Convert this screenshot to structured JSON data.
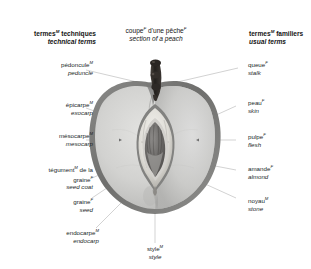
{
  "headings": {
    "left": {
      "fr": "termes",
      "fr_gender": "M",
      "fr_rest": " techniques",
      "en": "technical terms"
    },
    "center": {
      "fr": "coupe",
      "fr_gender": "F",
      "fr_rest": " d'une pêche",
      "fr_gender2": "F",
      "en": "section of a peach"
    },
    "right": {
      "fr": "termes",
      "fr_gender": "M",
      "fr_rest": " familiers",
      "en": "usual terms"
    }
  },
  "labels": {
    "peduncle": {
      "fr": "pédoncule",
      "gender": "M",
      "en": "peduncle"
    },
    "exocarp": {
      "fr": "épicarpe",
      "gender": "M",
      "en": "exocarp"
    },
    "mesocarp": {
      "fr": "mésocarpe",
      "gender": "M",
      "en": "mesocarp"
    },
    "seed_coat": {
      "fr_line1": "tégument",
      "gender": "M",
      "fr_line1_rest": " de la",
      "fr_line2": "graine",
      "gender2": "F",
      "en": "seed coat"
    },
    "seed": {
      "fr": "graine",
      "gender": "F",
      "en": "seed"
    },
    "endocarp": {
      "fr": "endocarpe",
      "gender": "M",
      "en": "endocarp"
    },
    "stalk": {
      "fr": "queue",
      "gender": "F",
      "en": "stalk"
    },
    "skin": {
      "fr": "peau",
      "gender": "F",
      "en": "skin"
    },
    "flesh": {
      "fr": "pulpe",
      "gender": "F",
      "en": "flesh"
    },
    "almond": {
      "fr": "amande",
      "gender": "F",
      "en": "almond"
    },
    "stone": {
      "fr": "noyau",
      "gender": "M",
      "en": "stone"
    },
    "style": {
      "fr": "style",
      "gender": "M",
      "en": "style"
    }
  },
  "colors": {
    "background": "#ffffff",
    "text": "#221f1f",
    "leader_line": "#9a9a9a",
    "skin_outer": "#7d7d7d",
    "flesh_light": "#d9d9d7",
    "flesh_mid": "#c4c4c2",
    "flesh_shadow": "#aeaeac",
    "stone_dark": "#6e6e6c",
    "stone_light": "#efeeea",
    "seed_dark": "#5e5c5a",
    "stem_dark": "#2b2724"
  }
}
